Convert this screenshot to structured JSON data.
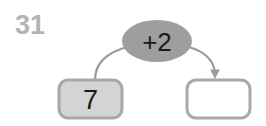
{
  "worksheet": {
    "exercise_number": "31",
    "number_color": "#b4b4b4"
  },
  "diagram": {
    "type": "function-machine",
    "operation": {
      "label": "+2",
      "shape": "ellipse",
      "fill_color": "#9e9e9e",
      "text_color": "#1a1a1a"
    },
    "input_box": {
      "value": "7",
      "fill_color": "#d4d4d4",
      "border_color": "#a8a8a8",
      "text_color": "#1a1a1a"
    },
    "output_box": {
      "value": "",
      "fill_color": "#ffffff",
      "border_color": "#a8a8a8",
      "text_color": "#1a1a1a"
    },
    "arrows": {
      "input_arrow": {
        "has_arrowhead": "false",
        "color": "#9a9a9a"
      },
      "output_arrow": {
        "has_arrowhead": "true",
        "color": "#9a9a9a"
      }
    }
  }
}
